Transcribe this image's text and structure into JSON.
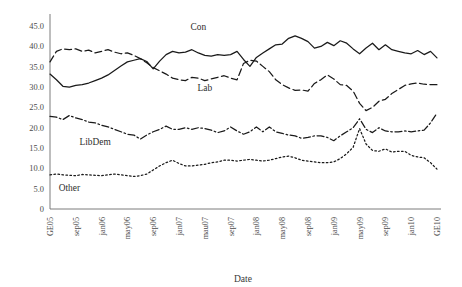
{
  "chart_data": {
    "type": "line",
    "title": "",
    "xlabel": "Date",
    "ylabel": "",
    "ylim": [
      0,
      47
    ],
    "yticks": [
      "0",
      "5.0",
      "10.0",
      "15.0",
      "20.0",
      "25.0",
      "30.0",
      "35.0",
      "40.0",
      "45.0"
    ],
    "ytick_values": [
      0,
      5,
      10,
      15,
      20,
      25,
      30,
      35,
      40,
      45
    ],
    "grid": false,
    "legend_position": "inline-annotations",
    "xtick_labels": [
      "GE05",
      "sep05",
      "jan06",
      "may06",
      "sep06",
      "jan07",
      "mau07",
      "sep07",
      "jan08",
      "may08",
      "sep08",
      "jan09",
      "may09",
      "sep09",
      "jan10",
      "GE10"
    ],
    "xtick_indices": [
      0,
      4,
      8,
      12,
      16,
      20,
      24,
      28,
      32,
      36,
      40,
      44,
      48,
      52,
      56,
      60
    ],
    "n_points": 61,
    "series": [
      {
        "name": "Con",
        "style": "solid",
        "label_x_index": 23,
        "label_y_value": 44.0,
        "values": [
          33.2,
          31.8,
          30.2,
          30.0,
          30.4,
          30.6,
          31.0,
          31.6,
          32.2,
          33.0,
          34.1,
          35.2,
          36.2,
          36.6,
          37.0,
          36.3,
          34.5,
          36.4,
          38.0,
          38.8,
          38.4,
          38.6,
          39.2,
          38.4,
          37.8,
          37.6,
          38.0,
          37.8,
          38.0,
          38.8,
          36.8,
          35.1,
          37.3,
          38.4,
          39.4,
          40.4,
          40.6,
          42.0,
          42.6,
          42.0,
          41.2,
          39.6,
          40.0,
          41.0,
          40.2,
          41.4,
          40.8,
          39.4,
          38.2,
          39.6,
          40.8,
          39.2,
          40.4,
          39.2,
          38.8,
          38.4,
          38.2,
          39.0,
          38.0,
          38.8,
          37.2
        ]
      },
      {
        "name": "Lab",
        "style": "dashed",
        "label_x_index": 24,
        "label_y_value": 29.0,
        "values": [
          36.2,
          38.8,
          39.4,
          39.2,
          39.4,
          38.8,
          39.1,
          38.4,
          38.8,
          39.2,
          38.6,
          38.2,
          38.4,
          37.8,
          37.0,
          36.0,
          34.8,
          34.0,
          33.2,
          32.2,
          31.8,
          31.6,
          32.4,
          32.2,
          31.6,
          32.0,
          32.4,
          32.8,
          32.2,
          31.8,
          35.8,
          36.6,
          36.4,
          35.1,
          33.8,
          31.8,
          30.6,
          29.8,
          29.2,
          29.3,
          29.0,
          30.9,
          31.8,
          33.0,
          32.0,
          30.6,
          30.4,
          29.0,
          26.0,
          24.2,
          25.0,
          26.5,
          27.0,
          28.4,
          29.4,
          30.4,
          30.8,
          31.0,
          30.7,
          30.6,
          30.6
        ]
      },
      {
        "name": "LibDem",
        "style": "dashdot",
        "label_x_index": 7,
        "label_y_value": 15.8,
        "values": [
          22.8,
          22.6,
          22.0,
          23.0,
          22.4,
          22.0,
          21.4,
          21.2,
          20.6,
          20.2,
          19.6,
          19.0,
          18.4,
          18.2,
          17.2,
          18.2,
          19.0,
          19.6,
          20.4,
          19.6,
          19.6,
          20.0,
          19.6,
          20.0,
          19.8,
          19.4,
          18.8,
          19.2,
          20.2,
          19.2,
          18.4,
          19.0,
          20.2,
          19.0,
          20.2,
          19.0,
          18.6,
          18.2,
          18.0,
          17.4,
          17.6,
          18.0,
          18.0,
          17.6,
          16.8,
          18.0,
          19.0,
          20.0,
          22.2,
          19.6,
          18.8,
          20.0,
          19.2,
          19.0,
          19.0,
          19.2,
          19.0,
          19.2,
          19.4,
          21.2,
          23.6
        ]
      },
      {
        "name": "Other",
        "style": "dotted",
        "label_x_index": 3,
        "label_y_value": 4.4,
        "values": [
          8.4,
          8.6,
          8.4,
          8.3,
          8.2,
          8.5,
          8.4,
          8.3,
          8.2,
          8.4,
          8.6,
          8.4,
          8.2,
          8.0,
          8.2,
          8.6,
          9.6,
          10.6,
          11.4,
          12.0,
          11.2,
          10.6,
          10.6,
          10.8,
          11.0,
          11.4,
          11.6,
          12.0,
          12.0,
          11.8,
          12.0,
          12.2,
          12.0,
          11.8,
          12.0,
          12.4,
          12.8,
          13.0,
          12.6,
          12.0,
          11.8,
          11.6,
          11.4,
          11.4,
          11.6,
          12.4,
          13.6,
          15.2,
          19.8,
          16.0,
          14.4,
          14.2,
          14.8,
          14.0,
          14.2,
          14.2,
          13.2,
          12.8,
          12.6,
          11.4,
          9.8
        ]
      }
    ]
  }
}
